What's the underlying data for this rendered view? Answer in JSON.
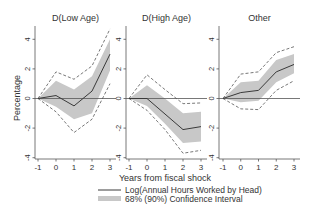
{
  "figure": {
    "ylabel": "Percentage",
    "xlabel": "Years from fiscal shock",
    "legend": {
      "line_label": "Log(Annual Hours Worked by Head)",
      "band_label": "68% (90%) Confidence Interval"
    },
    "colors": {
      "line": "#3a3a3a",
      "band": "#c8c8c8",
      "dashed": "#555555",
      "axis": "#555555",
      "zero_line": "#555555",
      "text": "#333333"
    }
  },
  "chart_data": [
    {
      "type": "line",
      "title": "D(Low Age)",
      "xlabel": "Years from fiscal shock",
      "ylabel": "Percentage",
      "x": [
        -1,
        0,
        1,
        2,
        3
      ],
      "xticks": [
        -1,
        0,
        1,
        2,
        3
      ],
      "yticks": [
        -4,
        -2,
        0,
        2,
        4
      ],
      "ylim": [
        -4.2,
        4.8
      ],
      "series": [
        {
          "name": "Log(Annual Hours Worked by Head)",
          "values": [
            0,
            0.2,
            -0.5,
            0.5,
            3.0
          ]
        },
        {
          "name": "68% CI lower",
          "values": [
            0,
            -0.55,
            -1.4,
            -1.0,
            1.9
          ]
        },
        {
          "name": "68% CI upper",
          "values": [
            0,
            1.2,
            0.6,
            1.5,
            4.0
          ]
        },
        {
          "name": "90% CI lower",
          "values": [
            0,
            -0.9,
            -2.3,
            -1.4,
            1.0
          ]
        },
        {
          "name": "90% CI upper",
          "values": [
            0,
            1.8,
            1.3,
            2.2,
            4.7
          ]
        }
      ]
    },
    {
      "type": "line",
      "title": "D(High Age)",
      "xlabel": "Years from fiscal shock",
      "ylabel": "Percentage",
      "x": [
        -1,
        0,
        1,
        2,
        3
      ],
      "xticks": [
        -1,
        0,
        1,
        2,
        3
      ],
      "yticks": [
        -4,
        -2,
        0,
        2,
        4
      ],
      "ylim": [
        -4.2,
        4.8
      ],
      "series": [
        {
          "name": "Log(Annual Hours Worked by Head)",
          "values": [
            0,
            0,
            -1.05,
            -2.1,
            -1.9
          ]
        },
        {
          "name": "68% CI lower",
          "values": [
            0,
            -0.5,
            -1.7,
            -3.0,
            -2.9
          ]
        },
        {
          "name": "68% CI upper",
          "values": [
            0,
            0.9,
            0.0,
            -1.0,
            -0.9
          ]
        },
        {
          "name": "90% CI lower",
          "values": [
            0,
            -0.8,
            -2.1,
            -3.7,
            -3.5
          ]
        },
        {
          "name": "90% CI upper",
          "values": [
            0,
            1.6,
            0.6,
            -0.35,
            -0.3
          ]
        }
      ]
    },
    {
      "type": "line",
      "title": "Other",
      "xlabel": "Years from fiscal shock",
      "ylabel": "Percentage",
      "x": [
        -1,
        0,
        1,
        2,
        3
      ],
      "xticks": [
        -1,
        0,
        1,
        2,
        3
      ],
      "yticks": [
        -4,
        -2,
        0,
        2,
        4
      ],
      "ylim": [
        -4.2,
        4.8
      ],
      "series": [
        {
          "name": "Log(Annual Hours Worked by Head)",
          "values": [
            0,
            0.4,
            0.55,
            1.8,
            2.3
          ]
        },
        {
          "name": "68% CI lower",
          "values": [
            0,
            -0.25,
            -0.15,
            1.1,
            1.7
          ]
        },
        {
          "name": "68% CI upper",
          "values": [
            0,
            1.1,
            1.2,
            2.6,
            3.0
          ]
        },
        {
          "name": "90% CI lower",
          "values": [
            0,
            -0.7,
            -0.75,
            0.55,
            1.2
          ]
        },
        {
          "name": "90% CI upper",
          "values": [
            0,
            1.65,
            1.8,
            3.1,
            3.5
          ]
        }
      ]
    }
  ]
}
